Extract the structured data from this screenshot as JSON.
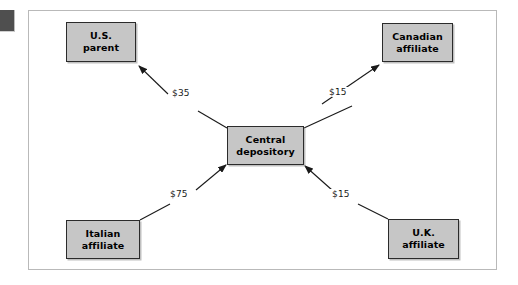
{
  "figure": {
    "type": "flow-diagram",
    "nodes": [
      {
        "id": "us-parent",
        "line1": "U.S.",
        "line2": "parent"
      },
      {
        "id": "canadian-affiliate",
        "line1": "Canadian",
        "line2": "affiliate"
      },
      {
        "id": "central-depository",
        "line1": "Central",
        "line2": "depository"
      },
      {
        "id": "italian-affiliate",
        "line1": "Italian",
        "line2": "affiliate"
      },
      {
        "id": "uk-affiliate",
        "line1": "U.K.",
        "line2": "affiliate"
      }
    ],
    "flows": [
      {
        "id": "flow-to-us",
        "amount": "$35",
        "from": "Central depository",
        "to": "U.S. parent",
        "direction": "outbound"
      },
      {
        "id": "flow-to-canada",
        "amount": "$15",
        "from": "Central depository",
        "to": "Canadian affiliate",
        "direction": "outbound"
      },
      {
        "id": "flow-from-italy",
        "amount": "$75",
        "from": "Italian affiliate",
        "to": "Central depository",
        "direction": "inbound"
      },
      {
        "id": "flow-from-uk",
        "amount": "$15",
        "from": "U.K. affiliate",
        "to": "Central depository",
        "direction": "inbound"
      }
    ],
    "colors": {
      "node_fill": "#c6c6c6",
      "node_border": "#2b2b2b",
      "frame_border": "#b9b9b9",
      "arrow": "#1a1a1a",
      "marker": "#4f4f4f",
      "background": "#ffffff"
    }
  }
}
